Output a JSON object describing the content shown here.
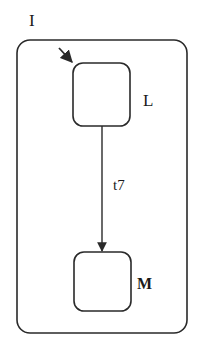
{
  "diagram": {
    "type": "statechart",
    "superstate": {
      "label": "I"
    },
    "states": [
      {
        "id": "L",
        "label": "L",
        "initial": true
      },
      {
        "id": "M",
        "label": "M"
      }
    ],
    "transitions": [
      {
        "from": "L",
        "to": "M",
        "label": "t7"
      }
    ],
    "colors": {
      "stroke": "#2a2a2a",
      "background": "#ffffff"
    }
  }
}
